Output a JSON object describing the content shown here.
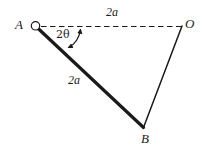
{
  "figure": {
    "type": "geometry-diagram",
    "background_color": "#ffffff",
    "ink_color": "#1a1a1a",
    "points": [
      {
        "id": "A",
        "label": "A",
        "x": 35,
        "y": 26,
        "marker": "open-circle-pivot"
      },
      {
        "id": "O",
        "label": "O",
        "x": 182,
        "y": 27,
        "marker": "none"
      },
      {
        "id": "B",
        "label": "B",
        "x": 143,
        "y": 127,
        "marker": "none"
      }
    ],
    "segments": [
      {
        "id": "AO",
        "from": "A",
        "to": "O",
        "style": "dashed",
        "weight": "thin",
        "label": "2a"
      },
      {
        "id": "AB",
        "from": "A",
        "to": "B",
        "style": "solid",
        "weight": "thick",
        "label": "2a"
      },
      {
        "id": "BO",
        "from": "B",
        "to": "O",
        "style": "solid",
        "weight": "thin",
        "label": ""
      }
    ],
    "angles": [
      {
        "id": "angle-at-A",
        "label": "2θ",
        "between": [
          "AB",
          "AO"
        ],
        "vertex": "A",
        "arrow": "double-headed-curved"
      }
    ],
    "labels": {
      "point_A": "A",
      "point_O": "O",
      "point_B": "B",
      "length_top": "2a",
      "length_ab": "2a",
      "angle_at_A": "2θ"
    }
  }
}
